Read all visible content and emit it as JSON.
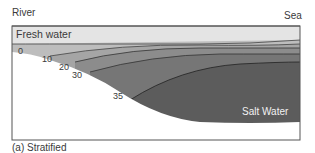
{
  "labels": {
    "river": "River",
    "sea": "Sea",
    "fresh_water": "Fresh water",
    "salt_water": "Salt Water",
    "caption": "(a) Stratified"
  },
  "isohalines": [
    "0",
    "10",
    "20",
    "30",
    "35"
  ],
  "colors": {
    "frame": "#555555",
    "fresh": "#e4e4e4",
    "layer10": "#bdbdbd",
    "layer20": "#a2a2a2",
    "layer30": "#8a8a8a",
    "layer35": "#6e6e6e",
    "salt": "#5a5a5a",
    "bed": "#ffffff"
  }
}
